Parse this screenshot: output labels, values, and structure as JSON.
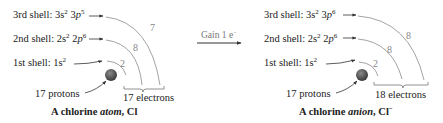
{
  "atom": {
    "shell3": {
      "label": "3rd shell: 3",
      "s_sup": "2",
      "p_pre": " 3",
      "p_letter": "p",
      "p_sup": "5",
      "count": "7"
    },
    "shell2": {
      "label": "2nd shell: 2",
      "s_sup": "2",
      "p_pre": " 2",
      "p_letter": "p",
      "p_sup": "6",
      "count": "8"
    },
    "shell1": {
      "label": "1st shell: 1",
      "s_letter": "s",
      "s_sup": "2",
      "count": "2"
    },
    "protons": "17 protons",
    "electrons": "17 electrons",
    "title_pre": "A chlorine ",
    "title_em": "atom",
    "title_post": ", Cl"
  },
  "arrow": {
    "label": "Gain 1 e",
    "label_sup": "−"
  },
  "anion": {
    "shell3": {
      "label": "3rd shell: 3",
      "s_sup": "2",
      "p_pre": " 3",
      "p_letter": "p",
      "p_sup": "6",
      "count": "8"
    },
    "shell2": {
      "label": "2nd shell: 2",
      "s_sup": "2",
      "p_pre": " 2",
      "p_letter": "p",
      "p_sup": "6",
      "count": "8"
    },
    "shell1": {
      "label": "1st shell: 1",
      "s_letter": "s",
      "s_sup": "2",
      "count": "2"
    },
    "protons": "17 protons",
    "electrons": "18 electrons",
    "title_pre": "A chlorine ",
    "title_em": "anion",
    "title_post": ", Cl",
    "title_sup": "−"
  },
  "colors": {
    "nucleus": "#4a4a4a",
    "arc": "#8a8a8a",
    "arrow": "#333333",
    "text": "#222222"
  }
}
